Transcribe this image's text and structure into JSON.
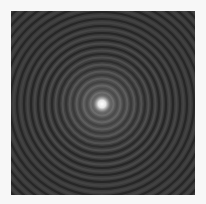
{
  "image": {
    "description": "Concentric ring interference / diffraction pattern",
    "center": [
      91,
      93
    ],
    "ring_spacing_px": 7,
    "colors": {
      "background": "#f7f7f7",
      "field": "#3a3a3a",
      "ring_dark": "#262626",
      "ring_light": "#5a5a5a",
      "core": "#ffffff"
    }
  }
}
